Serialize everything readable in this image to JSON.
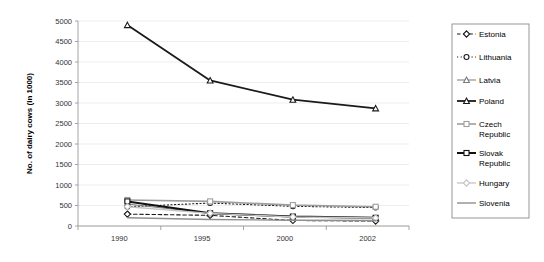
{
  "chart_data": {
    "type": "line",
    "title": "",
    "subtitle": "",
    "xlabel": "",
    "ylabel": "No. of dairy cows (in 1000)",
    "categories": [
      "1990",
      "1995",
      "2000",
      "2002"
    ],
    "x": [
      1990,
      1995,
      2000,
      2002
    ],
    "ylim": [
      0,
      5000
    ],
    "ytick_step": 500,
    "yticks": [
      "0",
      "500",
      "1000",
      "1500",
      "2000",
      "2500",
      "3000",
      "3500",
      "4000",
      "4500",
      "5000"
    ],
    "grid": true,
    "legend_position": "right",
    "series": [
      {
        "name": "Estonia",
        "values": [
          290,
          260,
          135,
          120
        ],
        "color": "#1a1a1a",
        "line_style": "dashed",
        "line_width": 1.1,
        "marker": "diamond"
      },
      {
        "name": "Lithuania",
        "values": [
          470,
          560,
          480,
          450
        ],
        "color": "#1a1a1a",
        "line_style": "dotted",
        "line_width": 1.1,
        "marker": "circle"
      },
      {
        "name": "Latvia",
        "values": [
          535,
          310,
          215,
          190
        ],
        "color": "#7a7a7a",
        "line_style": "solid",
        "line_width": 1.0,
        "marker": "triangle"
      },
      {
        "name": "Poland",
        "values": [
          4900,
          3550,
          3080,
          2870
        ],
        "color": "#1a1a1a",
        "line_style": "solid",
        "line_width": 1.8,
        "marker": "triangle"
      },
      {
        "name": "Czech Republic",
        "values": [
          635,
          600,
          510,
          470
        ],
        "color": "#9e9e9e",
        "line_style": "solid",
        "line_width": 1.6,
        "marker": "square"
      },
      {
        "name": "Slovak Republic",
        "values": [
          600,
          310,
          230,
          200
        ],
        "color": "#111111",
        "line_style": "solid",
        "line_width": 2.0,
        "marker": "square"
      },
      {
        "name": "Hungary",
        "values": [
          470,
          310,
          220,
          195
        ],
        "color": "#c4c4c4",
        "line_style": "solid",
        "line_width": 1.3,
        "marker": "diamond"
      },
      {
        "name": "Slovenia",
        "values": [
          200,
          160,
          140,
          135
        ],
        "color": "#8f8f8f",
        "line_style": "solid",
        "line_width": 1.4,
        "marker": "none"
      }
    ]
  },
  "legend": {
    "items": [
      {
        "label": "Estonia"
      },
      {
        "label": "Lithuania"
      },
      {
        "label": "Latvia"
      },
      {
        "label": "Poland"
      },
      {
        "label": "Czech",
        "label2": "Republic"
      },
      {
        "label": "Slovak",
        "label2": "Republic"
      },
      {
        "label": "Hungary"
      },
      {
        "label": "Slovenia"
      }
    ]
  },
  "colors": {
    "background": "#ffffff",
    "grid": "#e8e8e8",
    "axis": "#9a9a9a",
    "text": "#333333"
  }
}
